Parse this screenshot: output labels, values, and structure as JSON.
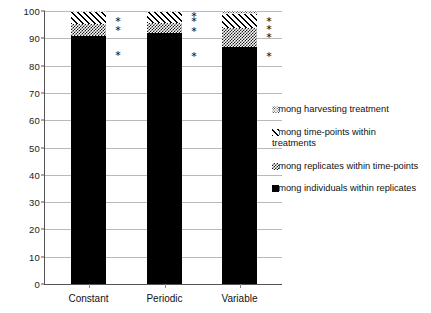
{
  "chart_data": {
    "type": "bar",
    "title": "",
    "subtitle": "",
    "xlabel": "",
    "ylabel": "",
    "stacked": true,
    "stack_total": 100,
    "grid": true,
    "ylim": [
      0,
      100
    ],
    "ytick_step": 10,
    "ytick_labels": [
      "0",
      "10",
      "20",
      "30",
      "40",
      "50",
      "60",
      "70",
      "80",
      "90",
      "100"
    ],
    "ytick_values": [
      0,
      10,
      20,
      30,
      40,
      50,
      60,
      70,
      80,
      90,
      100
    ],
    "categories": [
      "Constant",
      "Periodic",
      "Variable"
    ],
    "legend_position": "right",
    "series": [
      {
        "name": "Among individuals within replicates",
        "pattern": "solid",
        "values": [
          91.0,
          92.0,
          87.0
        ]
      },
      {
        "name": "Among replicates within time-points",
        "pattern": "checker",
        "values": [
          4.2,
          3.6,
          6.6
        ]
      },
      {
        "name": "Among time-points within treatments",
        "pattern": "hatch",
        "values": [
          4.3,
          3.9,
          5.4
        ]
      },
      {
        "name": "Among harvesting treatment",
        "pattern": "dots",
        "values": [
          0.5,
          0.5,
          1.0
        ]
      }
    ],
    "annotations": {
      "marker": "*",
      "description": "significance asterisks plotted to the right of each bar",
      "groups": [
        {
          "category": "Constant",
          "marks": [
            96.5,
            93.0,
            84.0
          ]
        },
        {
          "category": "Periodic",
          "marks": [
            98.0,
            96.5,
            92.5,
            83.5
          ]
        },
        {
          "category": "Variable",
          "marks": [
            96.5,
            93.5,
            90.5,
            83.5
          ]
        }
      ]
    }
  },
  "legend": {
    "items": [
      {
        "label": "Among harvesting treatment",
        "pattern": "dots"
      },
      {
        "label": "Among time-points within\ntreatments",
        "pattern": "hatch"
      },
      {
        "label": "Among replicates within time-points",
        "pattern": "checker"
      },
      {
        "label": "Among individuals within replicates",
        "pattern": "solid"
      }
    ]
  },
  "colors": {
    "axis": "#555555",
    "gridline": "#b9b9b9",
    "text": "#111111",
    "fill": "#000000",
    "background": "#ffffff"
  }
}
